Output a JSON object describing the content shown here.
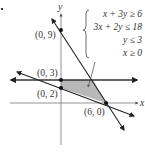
{
  "diagram": {
    "type": "linear-inequality-system-graph",
    "axes": {
      "x_label": "x",
      "y_label": "y"
    },
    "system": {
      "inequalities": [
        "x + 3y ≥ 6",
        "3x + 2y ≤ 18",
        "y ≤ 3",
        "x ≥ 0"
      ]
    },
    "points": [
      {
        "label": "(0, 9)"
      },
      {
        "label": "(0, 3)"
      },
      {
        "label": "(0, 2)"
      },
      {
        "label": "(6, 0)"
      }
    ],
    "colors": {
      "line": "#222222",
      "feasible_region": "#b8b8b8",
      "axis": "#666666"
    }
  }
}
